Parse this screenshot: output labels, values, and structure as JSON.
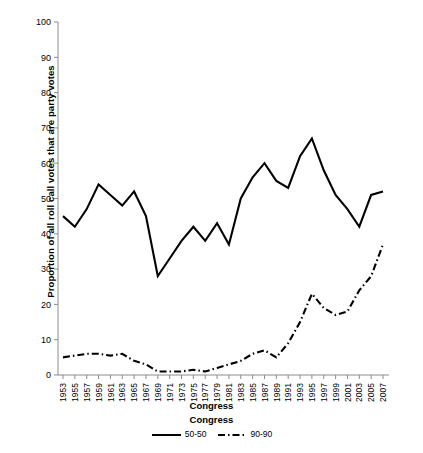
{
  "chart_data": {
    "type": "line",
    "title": "",
    "xlabel": "Congress",
    "ylabel": "Proportion of all roll call votes that are party votes",
    "ylim": [
      0,
      100
    ],
    "yticks": [
      0,
      10,
      20,
      30,
      40,
      50,
      60,
      70,
      80,
      90,
      100
    ],
    "grid": false,
    "legend_title": "Congress",
    "legend_position": "bottom",
    "categories": [
      "1953",
      "1955",
      "1957",
      "1959",
      "1961",
      "1963",
      "1965",
      "1967",
      "1969",
      "1971",
      "1973",
      "1975",
      "1977",
      "1979",
      "1981",
      "1983",
      "1985",
      "1987",
      "1989",
      "1991",
      "1993",
      "1995",
      "1997",
      "1999",
      "2001",
      "2003",
      "2005",
      "2007"
    ],
    "series": [
      {
        "name": "50-50",
        "style": "solid",
        "color": "#000000",
        "values": [
          45,
          42,
          47,
          54,
          51,
          48,
          52,
          45,
          28,
          33,
          38,
          42,
          38,
          43,
          37,
          50,
          56,
          60,
          55,
          53,
          62,
          67,
          58,
          51,
          47,
          42,
          51,
          52
        ]
      },
      {
        "name": "90-90",
        "style": "dash-dot",
        "color": "#000000",
        "values": [
          5,
          5.5,
          6,
          6,
          5.5,
          6,
          4,
          3,
          1,
          1,
          1,
          1.5,
          1,
          2,
          3,
          4,
          6,
          7,
          5,
          9,
          15,
          23,
          19,
          17,
          18,
          24,
          28,
          37
        ]
      }
    ]
  }
}
